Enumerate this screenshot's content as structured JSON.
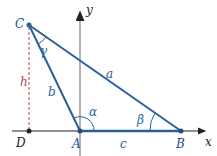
{
  "diagram": {
    "points": {
      "A": "A",
      "B": "B",
      "C": "C",
      "D": "D"
    },
    "sides": {
      "a": "a",
      "b": "b",
      "c": "c",
      "h": "h"
    },
    "angles": {
      "alpha": "α",
      "beta": "β",
      "gamma": "γ"
    },
    "axes": {
      "x": "x",
      "y": "y"
    },
    "colors": {
      "triangle": "#2a5f9e",
      "point_label": "#1f4f8a",
      "height": "#b04a4a",
      "axis": "#999999",
      "baseline": "#222222"
    }
  }
}
